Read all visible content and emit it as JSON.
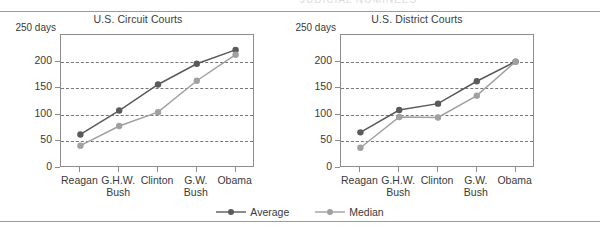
{
  "page": {
    "background": "#ffffff",
    "clipped_header_text": "JUDICIAL NOMINEES"
  },
  "legend": {
    "items": [
      {
        "label": "Average",
        "color": "#5a5a5a",
        "icon": "line-marker-icon"
      },
      {
        "label": "Median",
        "color": "#a0a0a0",
        "icon": "line-marker-icon"
      }
    ]
  },
  "colors": {
    "average": "#5a5a5a",
    "median": "#a0a0a0",
    "grid": "#777777",
    "axis": "#8d8d8d",
    "text": "#3a3a3a"
  },
  "chart_data": [
    {
      "id": "circuit-courts",
      "type": "line",
      "title": "U.S. Circuit Courts",
      "xlabel": "",
      "ylabel": "",
      "y_unit_label": "250 days",
      "categories": [
        "Reagan",
        "G.H.W. Bush",
        "Clinton",
        "G.W. Bush",
        "Obama"
      ],
      "category_lines": [
        [
          "Reagan",
          ""
        ],
        [
          "G.H.W.",
          "Bush"
        ],
        [
          "Clinton",
          ""
        ],
        [
          "G.W.",
          "Bush"
        ],
        [
          "Obama",
          ""
        ]
      ],
      "ylim": [
        0,
        250
      ],
      "yticks": [
        0,
        50,
        100,
        150,
        200
      ],
      "ytick_labels": [
        "0",
        "50",
        "100",
        "150",
        "200"
      ],
      "gridlines": [
        50,
        100,
        150,
        200
      ],
      "grid": true,
      "legend_position": "bottom-center-shared",
      "series": [
        {
          "name": "Average",
          "color": "#5a5a5a",
          "values": [
            63,
            108,
            157,
            196,
            222
          ]
        },
        {
          "name": "Median",
          "color": "#a0a0a0",
          "values": [
            42,
            79,
            105,
            164,
            213
          ]
        }
      ]
    },
    {
      "id": "district-courts",
      "type": "line",
      "title": "U.S. District Courts",
      "xlabel": "",
      "ylabel": "",
      "y_unit_label": "250 days",
      "categories": [
        "Reagan",
        "G.H.W. Bush",
        "Clinton",
        "G.W. Bush",
        "Obama"
      ],
      "category_lines": [
        [
          "Reagan",
          ""
        ],
        [
          "G.H.W.",
          "Bush"
        ],
        [
          "Clinton",
          ""
        ],
        [
          "G.W.",
          "Bush"
        ],
        [
          "Obama",
          ""
        ]
      ],
      "ylim": [
        0,
        250
      ],
      "yticks": [
        0,
        50,
        100,
        150,
        200
      ],
      "ytick_labels": [
        "0",
        "50",
        "100",
        "150",
        "200"
      ],
      "gridlines": [
        50,
        100,
        150,
        200
      ],
      "grid": true,
      "legend_position": "bottom-center-shared",
      "series": [
        {
          "name": "Average",
          "color": "#5a5a5a",
          "values": [
            67,
            109,
            121,
            163,
            200
          ]
        },
        {
          "name": "Median",
          "color": "#a0a0a0",
          "values": [
            38,
            96,
            95,
            136,
            200
          ]
        }
      ]
    }
  ]
}
